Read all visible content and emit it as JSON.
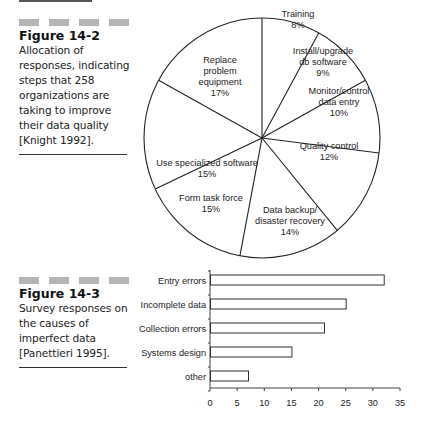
{
  "figures": [
    {
      "label": "Figure 14-2",
      "caption_lines": [
        "Allocation of",
        "responses, indicating",
        "steps that 258",
        "organizations are",
        "taking to improve",
        "their data quality",
        "[Knight 1992]."
      ]
    },
    {
      "label": "Figure 14-3",
      "caption_lines": [
        "Survey responses on",
        "the causes of",
        "imperfect data",
        "[Panettieri 1995]."
      ]
    }
  ],
  "chart_data": [
    {
      "type": "pie",
      "title": "Allocation of responses, indicating steps that 258 organizations are taking to improve their data quality",
      "slices": [
        {
          "label": "Training",
          "value": 8
        },
        {
          "label": "Install/upgrade db software",
          "value": 9
        },
        {
          "label": "Monitor/control data entry",
          "value": 10
        },
        {
          "label": "Quality control",
          "value": 12
        },
        {
          "label": "Data backup/ disaster recovery",
          "value": 14
        },
        {
          "label": "Form task force",
          "value": 15
        },
        {
          "label": "Use specialized software",
          "value": 15
        },
        {
          "label": "Replace problem equipment",
          "value": 17
        }
      ],
      "value_suffix": "%"
    },
    {
      "type": "bar",
      "orientation": "horizontal",
      "title": "Survey responses on the causes of imperfect data",
      "categories": [
        "Entry errors",
        "Incomplete data",
        "Collection errors",
        "Systems design",
        "other"
      ],
      "values": [
        32,
        25,
        21,
        15,
        7
      ],
      "xlabel": "",
      "ylabel": "",
      "xlim": [
        0,
        35
      ],
      "xticks": [
        0,
        5,
        10,
        15,
        20,
        25,
        30,
        35
      ],
      "grid": false
    }
  ],
  "pie_labels": [
    {
      "lines": [
        "Training",
        "8%"
      ]
    },
    {
      "lines": [
        "Install/upgrade",
        "db software",
        "9%"
      ]
    },
    {
      "lines": [
        "Monitor/control",
        "data entry",
        "10%"
      ]
    },
    {
      "lines": [
        "Quality control",
        "12%"
      ]
    },
    {
      "lines": [
        "Data backup/",
        "disaster recovery",
        "14%"
      ]
    },
    {
      "lines": [
        "Form task force",
        "15%"
      ]
    },
    {
      "lines": [
        "Use specialized software",
        "15%"
      ]
    },
    {
      "lines": [
        "Replace",
        "problem",
        "equipment",
        "17%"
      ]
    }
  ]
}
